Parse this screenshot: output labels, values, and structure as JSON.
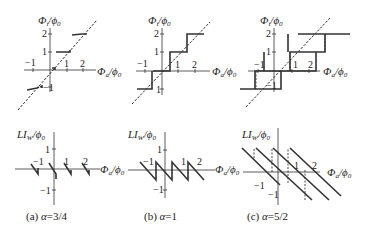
{
  "panels": [
    {
      "id": "a",
      "caption_prefix": "(a) ",
      "alpha_symbol": "α",
      "alpha_value": "=3/4",
      "top_ylabel": "Φ",
      "top_ylabel_sub": "i",
      "top_ylabel_den": "/ϕ",
      "top_ylabel_den_sub": "0",
      "bottom_ylabel": "LI",
      "bottom_ylabel_sub": "W",
      "bottom_ylabel_den": "/ϕ",
      "bottom_ylabel_den_sub": "0",
      "xlabel": "Φ",
      "xlabel_sub": "a",
      "xlabel_den": "/ϕ",
      "xlabel_den_sub": "0"
    },
    {
      "id": "b",
      "caption_prefix": "(b) ",
      "alpha_symbol": "α",
      "alpha_value": "=1",
      "top_ylabel": "Φ",
      "top_ylabel_sub": "i",
      "top_ylabel_den": "/ϕ",
      "top_ylabel_den_sub": "0",
      "bottom_ylabel": "LI",
      "bottom_ylabel_sub": "W",
      "bottom_ylabel_den": "/ϕ",
      "bottom_ylabel_den_sub": "0",
      "xlabel": "Φ",
      "xlabel_sub": "a",
      "xlabel_den": "/ϕ",
      "xlabel_den_sub": "0"
    },
    {
      "id": "c",
      "caption_prefix": "(c) ",
      "alpha_symbol": "α",
      "alpha_value": "=5/2",
      "top_ylabel": "Φ",
      "top_ylabel_sub": "i",
      "top_ylabel_den": "/ϕ",
      "top_ylabel_den_sub": "0",
      "bottom_ylabel": "LI",
      "bottom_ylabel_sub": "W",
      "bottom_ylabel_den": "/ϕ",
      "bottom_ylabel_den_sub": "0",
      "xlabel": "Φ",
      "xlabel_sub": "a",
      "xlabel_den": "/ϕ",
      "xlabel_den_sub": "0"
    }
  ],
  "ticks": {
    "m1": "−1",
    "p1": "1",
    "p2": "2",
    "m1y": "−1"
  }
}
